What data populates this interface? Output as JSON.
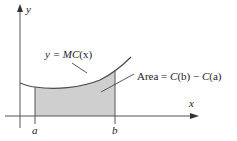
{
  "diagram": {
    "axes": {
      "x_label": "x",
      "y_label": "y"
    },
    "curve_label": {
      "prefix": "y = ",
      "func": "MC",
      "arg": "(x)"
    },
    "area_label": {
      "prefix": "Area = ",
      "c1": "C",
      "b_arg": "(b)",
      "minus": " − ",
      "c2": "C",
      "a_arg": "(a)"
    },
    "ticks": {
      "a": "a",
      "b": "b"
    },
    "colors": {
      "shade": "#cfcfcf",
      "line": "#4a4a4a",
      "axis": "#555555"
    }
  }
}
